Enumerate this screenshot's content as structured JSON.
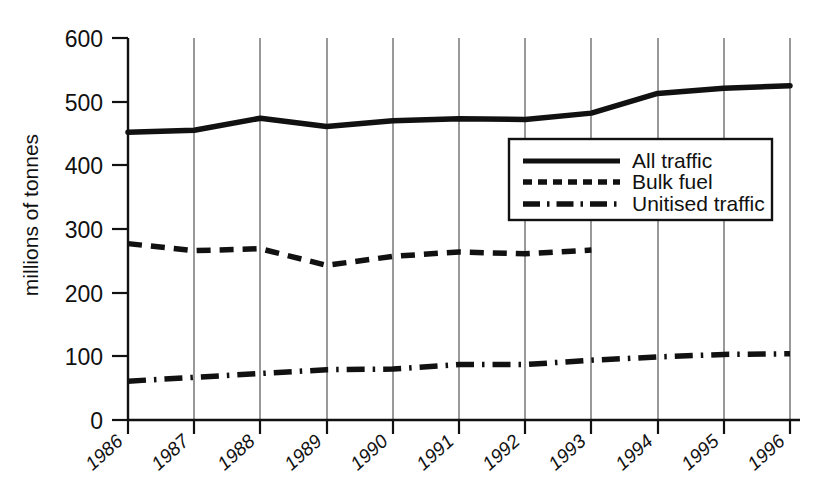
{
  "chart_data": {
    "type": "line",
    "title": "",
    "xlabel": "",
    "ylabel": "millions of tonnes",
    "categories": [
      "1986",
      "1987",
      "1988",
      "1989",
      "1990",
      "1991",
      "1992",
      "1993",
      "1994",
      "1995",
      "1996"
    ],
    "ylim": [
      0,
      600
    ],
    "yticks": [
      0,
      100,
      200,
      300,
      400,
      500,
      600
    ],
    "grid": "vertical",
    "legend_position": "inside-right-upper",
    "series": [
      {
        "name": "All traffic",
        "style": "solid",
        "values": [
          452,
          455,
          474,
          461,
          470,
          473,
          472,
          482,
          513,
          521,
          525
        ]
      },
      {
        "name": "Bulk fuel",
        "style": "dashed",
        "values": [
          277,
          266,
          269,
          243,
          257,
          264,
          261,
          267,
          null,
          null,
          null
        ]
      },
      {
        "name": "Unitised traffic",
        "style": "dash-dot",
        "values": [
          61,
          67,
          73,
          79,
          80,
          87,
          87,
          94,
          99,
          103,
          104
        ]
      }
    ]
  },
  "axis": {
    "y_tick_labels": [
      "600",
      "500",
      "400",
      "300",
      "200",
      "100",
      "0"
    ],
    "x_tick_labels": [
      "1986",
      "1987",
      "1988",
      "1989",
      "1990",
      "1991",
      "1992",
      "1993",
      "1994",
      "1995",
      "1996"
    ],
    "y_axis_title": "millions of tonnes"
  },
  "legend": {
    "items": [
      {
        "label": "All traffic",
        "style": "solid"
      },
      {
        "label": "Bulk fuel",
        "style": "dashed"
      },
      {
        "label": "Unitised traffic",
        "style": "dash-dot"
      }
    ]
  },
  "colors": {
    "ink": "#111111",
    "grid": "#555555",
    "background": "#ffffff"
  }
}
